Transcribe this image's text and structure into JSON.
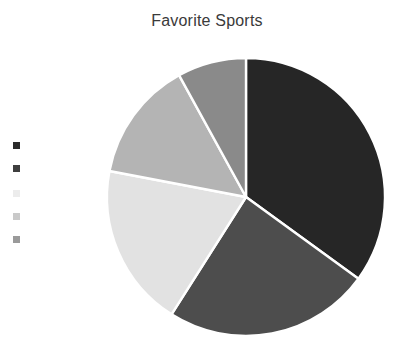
{
  "chart_data": {
    "type": "pie",
    "title": "Favorite Sports",
    "xlabel": "",
    "ylabel": "",
    "categories": [
      "Series 1",
      "Series 2",
      "Series 3",
      "Series 4",
      "Series 5"
    ],
    "values": [
      35,
      24,
      19,
      14,
      8
    ],
    "units": "percent",
    "start_angle_deg": 0,
    "direction": "clockwise",
    "grid": false,
    "legend_position": "left",
    "slice_colors": [
      "#262626",
      "#4d4d4d",
      "#e2e2e2",
      "#b4b4b4",
      "#8a8a8a"
    ],
    "slice_border_color": "#ffffff",
    "slices": [
      {
        "label": "Series 1",
        "value": 35,
        "color": "#262626",
        "start_deg": 0,
        "end_deg": 126
      },
      {
        "label": "Series 2",
        "value": 24,
        "color": "#4d4d4d",
        "start_deg": 126,
        "end_deg": 212.4
      },
      {
        "label": "Series 3",
        "value": 19,
        "color": "#e2e2e2",
        "start_deg": 212.4,
        "end_deg": 280.8
      },
      {
        "label": "Series 4",
        "value": 14,
        "color": "#b4b4b4",
        "start_deg": 280.8,
        "end_deg": 331.2
      },
      {
        "label": "Series 5",
        "value": 8,
        "color": "#8a8a8a",
        "start_deg": 331.2,
        "end_deg": 360
      }
    ],
    "geometry": {
      "center_x": 246,
      "center_y": 197,
      "radius": 139
    }
  },
  "title": {
    "text": "Favorite Sports",
    "color": "#3a3a3a"
  },
  "legend": {
    "marker_icon": "square-marker-icon",
    "items": [
      {
        "label": "Series 1",
        "color": "#2b2b2b",
        "top": 0
      },
      {
        "label": "Series 2",
        "color": "#3f3f3f",
        "top": 23
      },
      {
        "label": "Series 3",
        "color": "#ececec",
        "top": 48
      },
      {
        "label": "Series 4",
        "color": "#c9c9c9",
        "top": 71
      },
      {
        "label": "Series 5",
        "color": "#9a9a9a",
        "top": 94
      }
    ]
  },
  "background": {
    "color": "#ffffff"
  }
}
